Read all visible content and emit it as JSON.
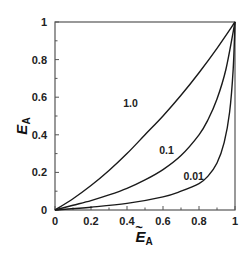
{
  "chart_data": {
    "type": "line",
    "title": "",
    "xlabel": "Ẽ_A",
    "ylabel": "E_A",
    "xlim": [
      0,
      1
    ],
    "ylim": [
      0,
      1
    ],
    "grid": false,
    "legend": "inline labels",
    "x_ticks": [
      "0",
      "0.2",
      "0.4",
      "0.6",
      "0.8",
      "1"
    ],
    "y_ticks": [
      "0",
      "0.2",
      "0.4",
      "0.6",
      "0.8",
      "1"
    ],
    "series": [
      {
        "name": "1.0",
        "label_pos": [
          0.42,
          0.55
        ],
        "x": [
          0,
          0.1,
          0.2,
          0.3,
          0.4,
          0.5,
          0.6,
          0.7,
          0.8,
          0.9,
          1.0
        ],
        "y": [
          0,
          0.06,
          0.13,
          0.21,
          0.3,
          0.4,
          0.5,
          0.61,
          0.73,
          0.86,
          1.0
        ]
      },
      {
        "name": "0.1",
        "label_pos": [
          0.62,
          0.3
        ],
        "x": [
          0,
          0.1,
          0.2,
          0.3,
          0.4,
          0.5,
          0.6,
          0.7,
          0.8,
          0.85,
          0.9,
          0.95,
          1.0
        ],
        "y": [
          0,
          0.025,
          0.05,
          0.08,
          0.115,
          0.16,
          0.215,
          0.29,
          0.4,
          0.48,
          0.59,
          0.75,
          1.0
        ]
      },
      {
        "name": "0.01",
        "label_pos": [
          0.77,
          0.16
        ],
        "x": [
          0,
          0.2,
          0.4,
          0.6,
          0.7,
          0.8,
          0.85,
          0.9,
          0.94,
          0.97,
          0.99,
          1.0
        ],
        "y": [
          0,
          0.015,
          0.035,
          0.07,
          0.1,
          0.14,
          0.18,
          0.25,
          0.36,
          0.52,
          0.75,
          1.0
        ]
      }
    ]
  },
  "axis": {
    "y_title": "E",
    "y_sub": "A",
    "x_title": "E",
    "x_sub": "A",
    "x_tilde": "~"
  },
  "colors": {
    "line": "#1a1a1a",
    "frame": "#555555"
  }
}
